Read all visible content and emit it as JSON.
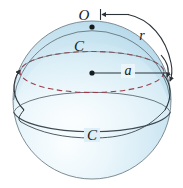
{
  "figure": {
    "background_color": "#ffffff",
    "width": 183,
    "height": 188
  },
  "sphere": {
    "center_x": 92,
    "center_y": 100,
    "radius": 79,
    "fill_light": "#f2f9fc",
    "fill_mid": "#d4e9f4",
    "fill_dark": "#b9dcec",
    "outline_color": "#6b7a85"
  },
  "labels": {
    "apex_point": "O",
    "radius": "r",
    "axis_segment": "a",
    "circle_upper": "C",
    "circle_lower": "C"
  },
  "colors": {
    "dashed_circle": "#9e3b46",
    "solid_stroke": "#3f4a52",
    "arrow_stroke": "#2b3338",
    "text": "#1a1a1a"
  },
  "geometry": {
    "apex_dot_x": 92,
    "apex_dot_y": 27,
    "center_dot_x": 92,
    "center_dot_y": 73,
    "axis_line_end_x": 170,
    "axis_line_y": 73
  }
}
